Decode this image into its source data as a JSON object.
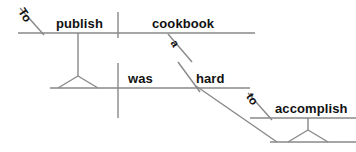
{
  "diagram": {
    "type": "reed-kellogg-sentence-diagram",
    "sentence": "To publish a cookbook was hard to accomplish.",
    "colors": {
      "background": "#ffffff",
      "line": "#888888",
      "text": "#111111"
    },
    "labels": {
      "to_infinitive_subject": "To",
      "publish": "publish",
      "article_a": "a",
      "cookbook": "cookbook",
      "was": "was",
      "hard": "hard",
      "to_infinitive_complement": "to",
      "accomplish": "accomplish"
    }
  }
}
